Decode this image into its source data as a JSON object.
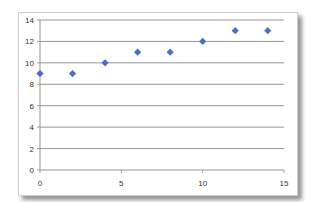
{
  "chart_data": {
    "type": "scatter",
    "title": "",
    "xlabel": "",
    "ylabel": "",
    "x": [
      0,
      2,
      4,
      6,
      8,
      10,
      12,
      14
    ],
    "series": [
      {
        "name": "Series1",
        "values": [
          9,
          9,
          10,
          11,
          11,
          12,
          13,
          13
        ],
        "color": "#4a6fc4",
        "marker": "diamond"
      }
    ],
    "xlim": [
      0,
      15
    ],
    "ylim": [
      0,
      14
    ],
    "x_ticks": [
      0,
      5,
      10,
      15
    ],
    "y_ticks": [
      0,
      2,
      4,
      6,
      8,
      10,
      12,
      14
    ],
    "grid": {
      "horizontal": true,
      "vertical": false
    },
    "legend": "none"
  }
}
